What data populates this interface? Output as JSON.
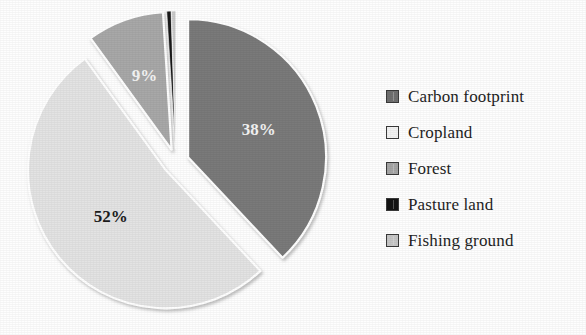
{
  "chart_data": {
    "type": "pie",
    "title": "",
    "subtitle": "",
    "xlabel": "",
    "ylabel": "",
    "exploded": true,
    "grid": false,
    "legend_position": "right",
    "categories": [
      "Carbon footprint",
      "Cropland",
      "Forest",
      "Pasture land",
      "Fishing ground"
    ],
    "values": [
      38,
      52,
      9,
      0.5,
      0.5
    ],
    "labels": [
      "38%",
      "52%",
      "9%",
      "",
      ""
    ],
    "colors": [
      "#7a7a7a",
      "#e3e3e3",
      "#a8a8a8",
      "#1a1a1a",
      "#c9c9c9"
    ],
    "slices": [
      {
        "name": "Carbon footprint",
        "value": 38,
        "label": "38%",
        "color": "#7a7a7a",
        "label_color": "#f4f4f4",
        "label_shown": true
      },
      {
        "name": "Cropland",
        "value": 52,
        "label": "52%",
        "color": "#e3e3e3",
        "label_color": "#1c1c1c",
        "label_shown": true
      },
      {
        "name": "Forest",
        "value": 9,
        "label": "9%",
        "color": "#a8a8a8",
        "label_color": "#f4f4f4",
        "label_shown": true
      },
      {
        "name": "Pasture land",
        "value": 0.5,
        "label": "",
        "color": "#1a1a1a",
        "label_color": "#1c1c1c",
        "label_shown": false
      },
      {
        "name": "Fishing ground",
        "value": 0.5,
        "label": "",
        "color": "#c9c9c9",
        "label_color": "#1c1c1c",
        "label_shown": false
      }
    ]
  },
  "chart": {
    "slice_1_label": "38%",
    "slice_2_label": "52%",
    "slice_3_label": "9%"
  },
  "legend": {
    "items": [
      {
        "label": "Carbon footprint",
        "color": "#6f6f6f"
      },
      {
        "label": "Cropland",
        "color": "#f2f2f2"
      },
      {
        "label": "Forest",
        "color": "#a5a5a5"
      },
      {
        "label": "Pasture land",
        "color": "#141414"
      },
      {
        "label": "Fishing ground",
        "color": "#c6c6c6"
      }
    ]
  }
}
